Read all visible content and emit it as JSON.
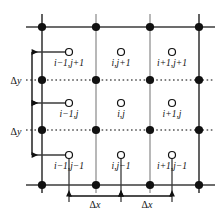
{
  "diagram": {
    "type": "finite-difference-grid",
    "colors": {
      "node_fill": "#111111",
      "boundary_line": "#3b3b3b",
      "interior_line": "#9a9a9a",
      "dotted_line": "#555555",
      "circle_stroke": "#111111",
      "text": "#111111",
      "background": "#ffffff"
    },
    "grid": {
      "columns": 4,
      "rows": 4,
      "node_x": [
        42,
        96,
        150,
        199
      ],
      "node_y": [
        27,
        80,
        130,
        185
      ],
      "node_marker": "filled-circle",
      "cell_marker": "open-circle",
      "boundary_style": "solid",
      "interior_vertical_style": "solid-gray",
      "interior_horizontal_style": "dotted"
    },
    "cells": [
      {
        "id": "c-im1-jp1",
        "label": "i−1,j+1",
        "cx": 69,
        "cy": 52,
        "label_x": 69,
        "label_y": 66,
        "row": 0,
        "col": 0
      },
      {
        "id": "c-i-jp1",
        "label": "i,j+1",
        "cx": 121,
        "cy": 52,
        "label_x": 121,
        "label_y": 66,
        "row": 0,
        "col": 1
      },
      {
        "id": "c-ip1-jp1",
        "label": "i+1,j+1",
        "cx": 172,
        "cy": 52,
        "label_x": 172,
        "label_y": 66,
        "row": 0,
        "col": 2
      },
      {
        "id": "c-im1-j",
        "label": "i−1,j",
        "cx": 69,
        "cy": 103,
        "label_x": 69,
        "label_y": 117,
        "row": 1,
        "col": 0
      },
      {
        "id": "c-i-j",
        "label": "i,j",
        "cx": 121,
        "cy": 103,
        "label_x": 121,
        "label_y": 117,
        "row": 1,
        "col": 1
      },
      {
        "id": "c-ip1-j",
        "label": "i+1,j",
        "cx": 172,
        "cy": 103,
        "label_x": 172,
        "label_y": 117,
        "row": 1,
        "col": 2
      },
      {
        "id": "c-im1-jm1",
        "label": "i−1,j−1",
        "cx": 69,
        "cy": 155,
        "label_x": 69,
        "label_y": 169,
        "row": 2,
        "col": 0
      },
      {
        "id": "c-i-jm1",
        "label": "i,j−1",
        "cx": 121,
        "cy": 155,
        "label_x": 121,
        "label_y": 169,
        "row": 2,
        "col": 1
      },
      {
        "id": "c-ip1-jm1",
        "label": "i+1,j−1",
        "cx": 172,
        "cy": 155,
        "label_x": 172,
        "label_y": 169,
        "row": 2,
        "col": 2
      }
    ],
    "dimensions": {
      "vertical": [
        {
          "id": "dy-upper",
          "symbol": "Δ",
          "variable": "y",
          "label": "Δy",
          "x": 32,
          "y_top": 52,
          "y_bottom": 103,
          "text_x": 16,
          "text_y": 80
        },
        {
          "id": "dy-lower",
          "symbol": "Δ",
          "variable": "y",
          "label": "Δy",
          "x": 32,
          "y_top": 103,
          "y_bottom": 155,
          "text_x": 16,
          "text_y": 131
        }
      ],
      "horizontal": [
        {
          "id": "dx-left",
          "symbol": "Δ",
          "variable": "x",
          "label": "Δx",
          "y": 196,
          "x_left": 69,
          "x_right": 121,
          "text_x": 95,
          "text_y": 207
        },
        {
          "id": "dx-right",
          "symbol": "Δ",
          "variable": "x",
          "label": "Δx",
          "y": 196,
          "x_left": 121,
          "x_right": 172,
          "text_x": 147,
          "text_y": 207
        }
      ]
    },
    "leaders": {
      "horizontal_to_circle": [
        {
          "id": "lead-dy-upper",
          "x_from": 32,
          "x_to": 69,
          "y": 52
        },
        {
          "id": "lead-dy-mid",
          "x_from": 32,
          "x_to": 69,
          "y": 103
        },
        {
          "id": "lead-dy-lower",
          "x_from": 32,
          "x_to": 69,
          "y": 155
        }
      ],
      "vertical_to_axis": [
        {
          "id": "lead-dx-a",
          "x": 69,
          "y_from": 155,
          "y_to": 202
        },
        {
          "id": "lead-dx-b",
          "x": 121,
          "y_from": 155,
          "y_to": 202
        },
        {
          "id": "lead-dx-c",
          "x": 172,
          "y_from": 155,
          "y_to": 202
        }
      ]
    }
  }
}
